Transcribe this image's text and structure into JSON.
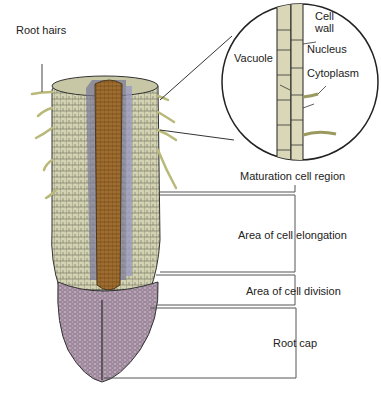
{
  "diagram": {
    "labels": {
      "root_hairs": "Root hairs",
      "cell_wall_1": "Cell",
      "cell_wall_2": "wall",
      "nucleus": "Nucleus",
      "vacuole": "Vacuole",
      "cytoplasm": "Cytoplasm",
      "maturation": "Maturation cell region",
      "elongation": "Area of cell elongation",
      "division": "Area of cell division",
      "root_cap": "Root cap"
    },
    "colors": {
      "cortex": "#cfcfae",
      "stele": "#9b6a2e",
      "endodermis": "#8f8fb0",
      "root_cap": "#b9a3b6",
      "root_hair": "#d8d8a0",
      "line": "#444444"
    }
  }
}
